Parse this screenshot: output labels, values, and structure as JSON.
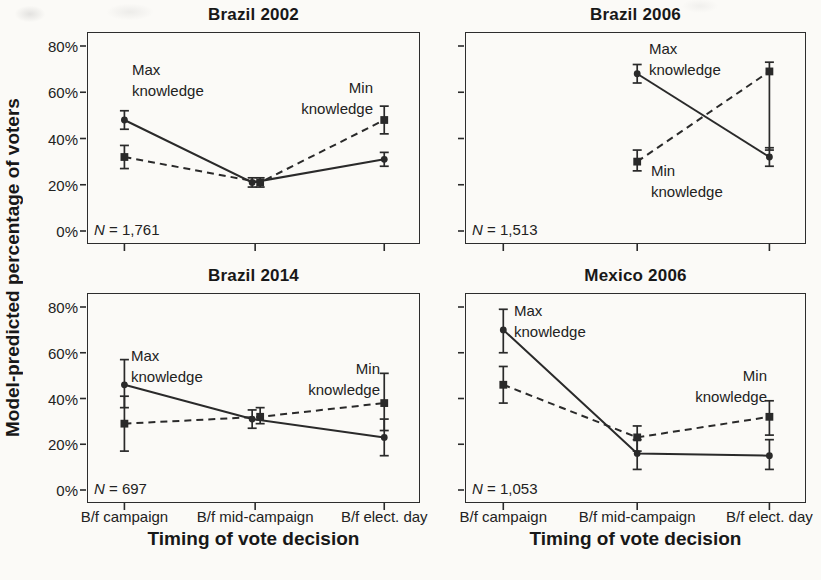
{
  "figure": {
    "y_axis_title": "Model-predicted percentage of voters",
    "x_axis_title": "Timing of vote decision",
    "y_tick_values": [
      0,
      20,
      40,
      60,
      80
    ],
    "y_tick_labels": [
      "0%",
      "20%",
      "40%",
      "60%",
      "80%"
    ],
    "x_tick_labels": [
      "B/f campaign",
      "B/f mid-campaign",
      "B/f elect. day"
    ],
    "ink_color": "#2a2a2a",
    "paper_color": "#fbfaf7"
  },
  "chart_data": [
    {
      "type": "line",
      "title": "Brazil 2002",
      "n_label": "N = 1,761",
      "categories": [
        "B/f campaign",
        "B/f mid-campaign",
        "B/f elect. day"
      ],
      "ylim": [
        0,
        80
      ],
      "yticks": [
        0,
        20,
        40,
        60,
        80
      ],
      "xlabel": "Timing of vote decision",
      "ylabel": "Model-predicted percentage of voters",
      "legend": "annotated-in-plot",
      "series": [
        {
          "name": "Max knowledge",
          "style": "solid",
          "marker": "circle",
          "values": [
            48,
            21,
            31
          ],
          "ci_low": [
            44,
            19,
            28
          ],
          "ci_high": [
            52,
            23,
            34
          ]
        },
        {
          "name": "Min knowledge",
          "style": "dashed",
          "marker": "square",
          "values": [
            32,
            21,
            48
          ],
          "ci_low": [
            27,
            19,
            42
          ],
          "ci_high": [
            37,
            23,
            54
          ]
        }
      ],
      "annotations": [
        {
          "lines": [
            "Max",
            "knowledge"
          ],
          "align": "left",
          "x": 44,
          "y": 26
        },
        {
          "lines": [
            "Min",
            "knowledge"
          ],
          "align": "right",
          "x": 46,
          "y": 44
        }
      ]
    },
    {
      "type": "line",
      "title": "Brazil 2006",
      "n_label": "N = 1,513",
      "categories": [
        "B/f campaign",
        "B/f mid-campaign",
        "B/f elect. day"
      ],
      "ylim": [
        0,
        80
      ],
      "yticks": [
        0,
        20,
        40,
        60,
        80
      ],
      "xlabel": "Timing of vote decision",
      "ylabel": "Model-predicted percentage of voters",
      "legend": "annotated-in-plot",
      "series": [
        {
          "name": "Max knowledge",
          "style": "solid",
          "marker": "circle",
          "values": [
            null,
            68,
            32
          ],
          "ci_low": [
            null,
            64,
            28
          ],
          "ci_high": [
            null,
            72,
            36
          ]
        },
        {
          "name": "Min knowledge",
          "style": "dashed",
          "marker": "square",
          "values": [
            null,
            30,
            69
          ],
          "ci_low": [
            null,
            26,
            35
          ],
          "ci_high": [
            null,
            35,
            73
          ]
        }
      ],
      "annotations": [
        {
          "lines": [
            "Max",
            "knowledge"
          ],
          "align": "left",
          "x": 183,
          "y": 5
        },
        {
          "lines": [
            "Min",
            "knowledge"
          ],
          "align": "left",
          "x": 185,
          "y": 127
        }
      ]
    },
    {
      "type": "line",
      "title": "Brazil 2014",
      "n_label": "N = 697",
      "categories": [
        "B/f campaign",
        "B/f mid-campaign",
        "B/f elect. day"
      ],
      "ylim": [
        0,
        80
      ],
      "yticks": [
        0,
        20,
        40,
        60,
        80
      ],
      "xlabel": "Timing of vote decision",
      "ylabel": "Model-predicted percentage of voters",
      "legend": "annotated-in-plot",
      "series": [
        {
          "name": "Max knowledge",
          "style": "solid",
          "marker": "circle",
          "values": [
            46,
            31,
            23
          ],
          "ci_low": [
            36,
            27,
            15
          ],
          "ci_high": [
            57,
            35,
            31
          ]
        },
        {
          "name": "Min knowledge",
          "style": "dashed",
          "marker": "square",
          "values": [
            29,
            32,
            38
          ],
          "ci_low": [
            17,
            29,
            26
          ],
          "ci_high": [
            41,
            36,
            51
          ]
        }
      ],
      "annotations": [
        {
          "lines": [
            "Max",
            "knowledge"
          ],
          "align": "left",
          "x": 43,
          "y": 51
        },
        {
          "lines": [
            "Min",
            "knowledge"
          ],
          "align": "right",
          "x": 39,
          "y": 64
        }
      ]
    },
    {
      "type": "line",
      "title": "Mexico 2006",
      "n_label": "N = 1,053",
      "categories": [
        "B/f campaign",
        "B/f mid-campaign",
        "B/f elect. day"
      ],
      "ylim": [
        0,
        80
      ],
      "yticks": [
        0,
        20,
        40,
        60,
        80
      ],
      "xlabel": "Timing of vote decision",
      "ylabel": "Model-predicted percentage of voters",
      "legend": "annotated-in-plot",
      "series": [
        {
          "name": "Max knowledge",
          "style": "solid",
          "marker": "circle",
          "values": [
            70,
            16,
            15
          ],
          "ci_low": [
            60,
            9,
            9
          ],
          "ci_high": [
            79,
            22,
            22
          ]
        },
        {
          "name": "Min knowledge",
          "style": "dashed",
          "marker": "square",
          "values": [
            46,
            23,
            32
          ],
          "ci_low": [
            38,
            17,
            24
          ],
          "ci_high": [
            54,
            28,
            39
          ]
        }
      ],
      "annotations": [
        {
          "lines": [
            "Max",
            "knowledge"
          ],
          "align": "left",
          "x": 48,
          "y": 6
        },
        {
          "lines": [
            "Min",
            "knowledge"
          ],
          "align": "right",
          "x": 38,
          "y": 71
        }
      ]
    }
  ]
}
